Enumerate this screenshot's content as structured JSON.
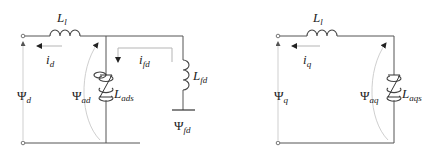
{
  "diagram": {
    "d_axis": {
      "leakage_inductor": {
        "symbol": "L",
        "sub": "l"
      },
      "current": {
        "symbol": "i",
        "sub": "d"
      },
      "terminal_flux": {
        "symbol": "Ψ",
        "sub": "d"
      },
      "air_gap_flux": {
        "symbol": "Ψ",
        "sub": "ad"
      },
      "magnetizing_inductor": {
        "symbol": "L",
        "sub": "ads",
        "type": "saturable"
      },
      "field_current": {
        "symbol": "i",
        "sub": "fd"
      },
      "field_inductor": {
        "symbol": "L",
        "sub": "fd"
      },
      "field_flux": {
        "symbol": "Ψ",
        "sub": "fd"
      }
    },
    "q_axis": {
      "leakage_inductor": {
        "symbol": "L",
        "sub": "l"
      },
      "current": {
        "symbol": "i",
        "sub": "q"
      },
      "terminal_flux": {
        "symbol": "Ψ",
        "sub": "q"
      },
      "air_gap_flux": {
        "symbol": "Ψ",
        "sub": "aq"
      },
      "magnetizing_inductor": {
        "symbol": "L",
        "sub": "aqs",
        "type": "saturable"
      }
    }
  }
}
